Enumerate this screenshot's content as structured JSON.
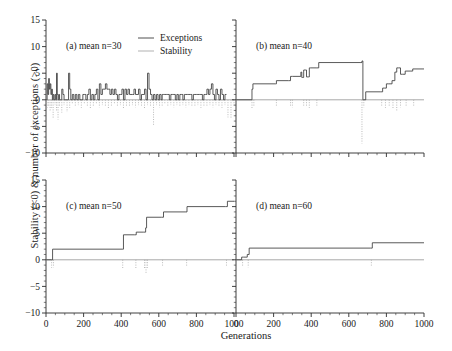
{
  "chart_data": {
    "type": "line",
    "title": "",
    "xlabel": "Generations",
    "ylabel": "Stability (<0) & number of exceptions (>0)",
    "xlim": [
      0,
      1000
    ],
    "ylim": [
      -10,
      15
    ],
    "xticks": [
      0,
      200,
      400,
      600,
      800,
      1000
    ],
    "yticks": [
      -10,
      -5,
      0,
      5,
      10,
      15
    ],
    "grid": false,
    "legend_position": "top-center-of-panel-a",
    "legend": [
      {
        "name": "Exceptions",
        "color": "#3c3c3c",
        "style": "solid"
      },
      {
        "name": "Stability",
        "color": "#a8a8a8",
        "style": "solid"
      }
    ],
    "panels": [
      {
        "label": "(a) mean n=30",
        "mean_n": 30,
        "series": [
          {
            "name": "Exceptions",
            "color": "#3c3c3c",
            "style": "step",
            "x": [
              0,
              6,
              10,
              14,
              18,
              22,
              26,
              30,
              34,
              38,
              42,
              48,
              52,
              56,
              60,
              64,
              68,
              72,
              78,
              84,
              90,
              96,
              104,
              112,
              120,
              126,
              132,
              140,
              148,
              156,
              164,
              172,
              180,
              188,
              196,
              204,
              212,
              220,
              228,
              236,
              244,
              252,
              260,
              268,
              276,
              284,
              292,
              300,
              308,
              316,
              324,
              332,
              340,
              348,
              356,
              364,
              372,
              380,
              388,
              396,
              404,
              412,
              420,
              428,
              436,
              444,
              452,
              460,
              468,
              476,
              484,
              492,
              500,
              508,
              516,
              524,
              532,
              540,
              548,
              556,
              564,
              572,
              580,
              588,
              596,
              604,
              612,
              618,
              624,
              632,
              640,
              648,
              656,
              664,
              672,
              680,
              688,
              696,
              704,
              712,
              720,
              728,
              736,
              744,
              752,
              760,
              768,
              776,
              784,
              792,
              800,
              808,
              816,
              824,
              832,
              840,
              848,
              856,
              864,
              872,
              880,
              888,
              896,
              904,
              912,
              920,
              928,
              936,
              944,
              952,
              960,
              968,
              976,
              984,
              992,
              1000
            ],
            "y": [
              0,
              3,
              1,
              4,
              2,
              3,
              1,
              2,
              0,
              1,
              0,
              1,
              0,
              5,
              1,
              0,
              1,
              0,
              0,
              2,
              1,
              0,
              0,
              0,
              5,
              2,
              0,
              1,
              0,
              1,
              0,
              1,
              0,
              0,
              1,
              1,
              0,
              1,
              2,
              0,
              1,
              0,
              1,
              2,
              0,
              3,
              1,
              2,
              2,
              3,
              2,
              2,
              1,
              2,
              1,
              2,
              1,
              0,
              1,
              1,
              2,
              0,
              2,
              1,
              2,
              1,
              1,
              1,
              2,
              1,
              1,
              2,
              0,
              1,
              1,
              2,
              0,
              5,
              2,
              1,
              0,
              1,
              0,
              1,
              0,
              1,
              0,
              1,
              1,
              1,
              1,
              1,
              0,
              1,
              1,
              1,
              0,
              1,
              0,
              1,
              1,
              0,
              1,
              1,
              1,
              1,
              1,
              0,
              1,
              1,
              1,
              1,
              1,
              1,
              0,
              1,
              1,
              2,
              1,
              2,
              3,
              1,
              0,
              2,
              1,
              0,
              2,
              1,
              0,
              1
            ]
          },
          {
            "name": "Stability",
            "color": "#a8a8a8",
            "style": "drop",
            "x": [
              6,
              14,
              22,
              30,
              38,
              48,
              56,
              64,
              72,
              84,
              96,
              112,
              126,
              140,
              156,
              172,
              188,
              204,
              220,
              236,
              252,
              268,
              284,
              300,
              316,
              332,
              348,
              364,
              380,
              396,
              412,
              428,
              444,
              460,
              476,
              492,
              508,
              524,
              540,
              556,
              572,
              588,
              604,
              618,
              632,
              648,
              664,
              680,
              696,
              712,
              728,
              744,
              760,
              776,
              792,
              808,
              824,
              840,
              856,
              872,
              888,
              904,
              920,
              936,
              952,
              968,
              984,
              1000
            ],
            "y": [
              -1.5,
              -1.2,
              -2,
              -1.5,
              -3.6,
              -1,
              -2,
              -3.7,
              -1.2,
              -2.4,
              -1,
              -2.3,
              -1.5,
              -0.8,
              -1.2,
              -1,
              -1.5,
              -0.8,
              -1.2,
              -1.6,
              -1.2,
              -0.8,
              -1.4,
              -1,
              -1.3,
              -1.7,
              -1.2,
              -0.9,
              -1.2,
              -1,
              -1.6,
              -1.1,
              -1.3,
              -1,
              -1.4,
              -1,
              -1.2,
              -1.6,
              -1,
              -1.3,
              -4.7,
              -1,
              -1.4,
              -1.1,
              -0.9,
              -1.3,
              -1,
              -1.4,
              -1,
              -1.2,
              -1,
              -1.4,
              -1,
              -1.1,
              -1.3,
              -1,
              -1.5,
              -1.1,
              -1.3,
              -1,
              -1.4,
              -1,
              -1.2,
              -1.5,
              -1,
              -3.3,
              -3.5,
              -1.2
            ]
          }
        ]
      },
      {
        "label": "(b) mean n=40",
        "mean_n": 40,
        "series": [
          {
            "name": "Exceptions",
            "color": "#3c3c3c",
            "style": "step",
            "x": [
              0,
              80,
              85,
              90,
              210,
              215,
              280,
              290,
              300,
              345,
              350,
              355,
              360,
              370,
              375,
              385,
              390,
              395,
              430,
              440,
              660,
              665,
              670,
              675,
              680,
              690,
              770,
              780,
              790,
              800,
              810,
              830,
              845,
              855,
              865,
              875,
              885,
              900,
              930,
              940,
              1000
            ],
            "y": [
              0,
              0,
              2,
              3,
              3,
              3.6,
              3.6,
              4.4,
              4.4,
              5.2,
              4.2,
              4.2,
              5.6,
              5.6,
              4.3,
              4.3,
              6,
              6,
              6,
              7,
              7,
              7,
              7.3,
              0,
              0,
              1.5,
              1.5,
              2.2,
              2.2,
              3,
              3,
              3.6,
              5.2,
              6,
              6,
              4.8,
              4.8,
              5.4,
              5.4,
              5.8,
              5.8
            ]
          },
          {
            "name": "Stability",
            "color": "#a8a8a8",
            "style": "drop",
            "x": [
              85,
              95,
              215,
              290,
              300,
              360,
              375,
              390,
              430,
              670,
              680,
              775,
              795,
              815,
              835,
              855,
              875,
              905,
              945
            ],
            "y": [
              -1.6,
              -1.3,
              -1.3,
              -1.2,
              -1.4,
              -1.3,
              -1.2,
              -1.5,
              -1.3,
              -8.2,
              -1.4,
              -1.2,
              -1.5,
              -1.3,
              -1.6,
              -2.1,
              -1.4,
              -1.2,
              -1.1
            ]
          }
        ]
      },
      {
        "label": "(c) mean n=50",
        "mean_n": 50,
        "series": [
          {
            "name": "Exceptions",
            "color": "#3c3c3c",
            "style": "step",
            "x": [
              0,
              30,
              35,
              405,
              412,
              470,
              480,
              520,
              530,
              535,
              615,
              625,
              740,
              750,
              955,
              965,
              1000
            ],
            "y": [
              0,
              0,
              2,
              2,
              4.7,
              4.7,
              5.2,
              5.2,
              6,
              8,
              8,
              9,
              9,
              10,
              10,
              11,
              11
            ]
          },
          {
            "name": "Stability",
            "color": "#a8a8a8",
            "style": "drop",
            "x": [
              30,
              40,
              408,
              478,
              524,
              532,
              540,
              620,
              748,
              960
            ],
            "y": [
              -1.5,
              -1.4,
              -1.8,
              -1.6,
              -1.7,
              -2.5,
              -1.5,
              -1.3,
              -1.2,
              -1.2
            ]
          }
        ]
      },
      {
        "label": "(d) mean n=60",
        "mean_n": 60,
        "series": [
          {
            "name": "Exceptions",
            "color": "#3c3c3c",
            "style": "step",
            "x": [
              0,
              30,
              40,
              60,
              70,
              715,
              725,
              1000
            ],
            "y": [
              0,
              0.5,
              0.5,
              1,
              2.2,
              2.2,
              3.2,
              3.2
            ]
          },
          {
            "name": "Stability",
            "color": "#a8a8a8",
            "style": "drop",
            "x": [
              35,
              65,
              720
            ],
            "y": [
              -1.2,
              -1.4,
              -1.3
            ]
          }
        ]
      }
    ]
  },
  "axes": {
    "ylabel": "Stability (<0) & number of exceptions (>0)",
    "xlabel": "Generations",
    "ytick_labels": [
      "15",
      "10",
      "5",
      "0",
      "-5",
      "-10"
    ],
    "xtick_labels": [
      "0",
      "200",
      "400",
      "600",
      "800",
      "1000"
    ]
  },
  "legend": {
    "exceptions_label": "Exceptions",
    "stability_label": "Stability"
  },
  "panel_labels": {
    "a": "(a) mean n=30",
    "b": "(b) mean n=40",
    "c": "(c) mean n=50",
    "d": "(d) mean n=60"
  },
  "colors": {
    "exceptions": "#3c3c3c",
    "stability": "#a8a8a8",
    "axis": "#2b2b2b"
  }
}
